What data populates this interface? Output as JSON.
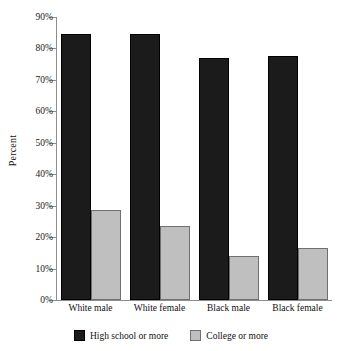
{
  "chart_data": {
    "type": "bar",
    "title": "",
    "subtitle": "",
    "xlabel": "",
    "ylabel": "Percent",
    "ylim": [
      0,
      90
    ],
    "grid": false,
    "legend_position": "bottom",
    "categories": [
      "White male",
      "White female",
      "Black male",
      "Black female"
    ],
    "ytick_labels": [
      "0%",
      "10%",
      "20%",
      "30%",
      "40%",
      "50%",
      "60%",
      "70%",
      "80%",
      "90%"
    ],
    "ytick_values": [
      0,
      10,
      20,
      30,
      40,
      50,
      60,
      70,
      80,
      90
    ],
    "series": [
      {
        "name": "High school or more",
        "color": "#1b1b1b",
        "values": [
          84.5,
          84.5,
          77.0,
          77.5
        ]
      },
      {
        "name": "College or more",
        "color": "#bfbfbf",
        "values": [
          28.5,
          23.5,
          14.0,
          16.5
        ]
      }
    ]
  },
  "legend": {
    "items": [
      {
        "label": "High school or more"
      },
      {
        "label": "College or more"
      }
    ]
  }
}
